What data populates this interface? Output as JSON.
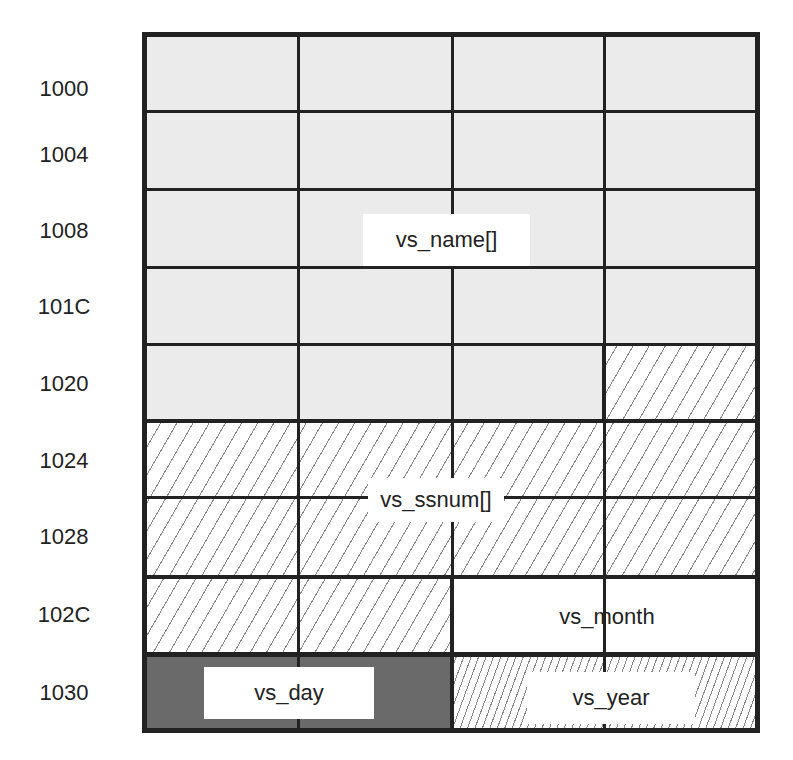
{
  "diagram": {
    "addresses": [
      "1000",
      "1004",
      "1008",
      "101C",
      "1020",
      "1024",
      "1028",
      "102C",
      "1030"
    ],
    "fields": {
      "vs_name": "vs_name[]",
      "vs_ssnum": "vs_ssnum[]",
      "vs_month": "vs_month",
      "vs_day": "vs_day",
      "vs_year": "vs_year"
    },
    "colors": {
      "name_fill": "#ebebeb",
      "day_fill": "#6a6a6a",
      "month_fill": "#ffffff",
      "grid_line": "#222222"
    }
  }
}
